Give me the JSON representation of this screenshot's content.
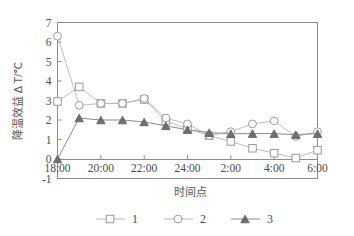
{
  "chart_data": {
    "type": "line",
    "title": "",
    "xlabel": "时间点",
    "ylabel": "降温效益 Δ T/℃",
    "x": [
      "18:00",
      "19:00",
      "20:00",
      "21:00",
      "22:00",
      "23:00",
      "24:00",
      "1:00",
      "2:00",
      "3:00",
      "4:00",
      "5:00",
      "6:00"
    ],
    "xtick_labels": [
      "18:00",
      "20:00",
      "22:00",
      "24:00",
      "2:00",
      "4:00",
      "6:00"
    ],
    "ytick_labels": [
      "-1",
      "0",
      "1",
      "2",
      "3",
      "4",
      "5",
      "6",
      "7"
    ],
    "ylim": [
      -1,
      7
    ],
    "grid": false,
    "legend_position": "bottom",
    "series": [
      {
        "name": "1",
        "marker": "open-square",
        "color": "#9a9a9a",
        "values": [
          2.95,
          3.7,
          2.85,
          2.85,
          3.05,
          1.95,
          1.55,
          1.2,
          0.9,
          0.55,
          0.3,
          0.05,
          0.45
        ]
      },
      {
        "name": "2",
        "marker": "open-circle",
        "color": "#9a9a9a",
        "values": [
          6.3,
          2.75,
          2.85,
          2.85,
          3.1,
          2.1,
          1.8,
          1.2,
          1.4,
          1.8,
          1.95,
          1.15,
          1.4
        ]
      },
      {
        "name": "3",
        "marker": "filled-triangle",
        "color": "#6f6f6f",
        "values": [
          0.0,
          2.1,
          2.0,
          2.0,
          1.9,
          1.7,
          1.5,
          1.35,
          1.3,
          1.3,
          1.3,
          1.25,
          1.3
        ]
      }
    ]
  },
  "legend": {
    "entries": [
      {
        "label": "1",
        "marker": "open-square"
      },
      {
        "label": "2",
        "marker": "open-circle"
      },
      {
        "label": "3",
        "marker": "filled-triangle"
      }
    ]
  },
  "axes": {
    "y_axis_title": "降温效益 Δ T/℃",
    "x_axis_title": "时间点"
  }
}
